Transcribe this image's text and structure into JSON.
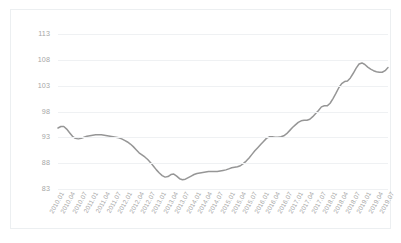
{
  "chart_data": {
    "type": "line",
    "title": "",
    "subtitle": "",
    "xlabel": "",
    "ylabel": "",
    "ylim": [
      83,
      113
    ],
    "yticks": [
      83,
      88,
      93,
      98,
      103,
      108,
      113
    ],
    "grid": true,
    "legend": false,
    "legend_position": "none",
    "line_color": "#969696",
    "gridline_color": "#eff1f3",
    "axis_label_color": "#a6a6a6",
    "border_color": "#eceff1",
    "x_tick_rotation": -61,
    "x_tick_labels": [
      "2010.01",
      "2010.04",
      "2010.07",
      "2011.01",
      "2011.04",
      "2011.07",
      "2012.01",
      "2012.04",
      "2012.07",
      "2013.01",
      "2013.04",
      "2013.07",
      "2014.01",
      "2014.04",
      "2014.07",
      "2015.01",
      "2015.04",
      "2015.07",
      "2016.01",
      "2016.04",
      "2016.07",
      "2017.01",
      "2017.04",
      "2017.07",
      "2018.01",
      "2018.04",
      "2018.07",
      "2019.01",
      "2019.04",
      "2019.07"
    ],
    "x": [
      "2010.01",
      "2010.02",
      "2010.03",
      "2010.04",
      "2010.05",
      "2010.06",
      "2010.07",
      "2010.08",
      "2010.09",
      "2010.10",
      "2010.11",
      "2010.12",
      "2011.01",
      "2011.02",
      "2011.03",
      "2011.04",
      "2011.05",
      "2011.06",
      "2011.07",
      "2011.08",
      "2011.09",
      "2011.10",
      "2011.11",
      "2011.12",
      "2012.01",
      "2012.02",
      "2012.03",
      "2012.04",
      "2012.05",
      "2012.06",
      "2012.07",
      "2012.08",
      "2012.09",
      "2012.10",
      "2012.11",
      "2012.12",
      "2013.01",
      "2013.02",
      "2013.03",
      "2013.04",
      "2013.05",
      "2013.06",
      "2013.07",
      "2013.08",
      "2013.09",
      "2013.10",
      "2013.11",
      "2013.12",
      "2014.01",
      "2014.02",
      "2014.03",
      "2014.04",
      "2014.05",
      "2014.06",
      "2014.07",
      "2014.08",
      "2014.09",
      "2014.10",
      "2014.11",
      "2014.12",
      "2015.01",
      "2015.02",
      "2015.03",
      "2015.04",
      "2015.05",
      "2015.06",
      "2015.07",
      "2015.08",
      "2015.09",
      "2015.10",
      "2015.11",
      "2015.12",
      "2016.01",
      "2016.02",
      "2016.03",
      "2016.04",
      "2016.05",
      "2016.06",
      "2016.07",
      "2016.08",
      "2016.09",
      "2016.10",
      "2016.11",
      "2016.12",
      "2017.01",
      "2017.02",
      "2017.03",
      "2017.04",
      "2017.05",
      "2017.06",
      "2017.07",
      "2017.08",
      "2017.09",
      "2017.10",
      "2017.11",
      "2017.12",
      "2018.01",
      "2018.02",
      "2018.03",
      "2018.04",
      "2018.05",
      "2018.06",
      "2018.07",
      "2018.08",
      "2018.09",
      "2018.10",
      "2018.11",
      "2018.12",
      "2019.01",
      "2019.02",
      "2019.03",
      "2019.04",
      "2019.05",
      "2019.06",
      "2019.07"
    ],
    "values": [
      94.8,
      95.1,
      95.1,
      94.6,
      93.9,
      93.2,
      92.8,
      92.7,
      92.8,
      93.0,
      93.2,
      93.3,
      93.4,
      93.5,
      93.5,
      93.5,
      93.4,
      93.3,
      93.2,
      93.1,
      93.0,
      92.9,
      92.7,
      92.4,
      92.1,
      91.7,
      91.2,
      90.6,
      90.0,
      89.6,
      89.2,
      88.7,
      88.1,
      87.4,
      86.7,
      86.1,
      85.6,
      85.3,
      85.4,
      85.8,
      85.9,
      85.5,
      85.0,
      84.8,
      84.9,
      85.2,
      85.5,
      85.8,
      86.0,
      86.1,
      86.2,
      86.3,
      86.4,
      86.4,
      86.4,
      86.4,
      86.5,
      86.6,
      86.7,
      86.9,
      87.1,
      87.2,
      87.3,
      87.5,
      87.9,
      88.4,
      89.0,
      89.7,
      90.4,
      91.0,
      91.6,
      92.2,
      92.8,
      93.1,
      93.1,
      93.0,
      93.0,
      93.1,
      93.3,
      93.7,
      94.3,
      94.9,
      95.4,
      95.9,
      96.2,
      96.3,
      96.3,
      96.5,
      97.0,
      97.6,
      98.2,
      98.9,
      99.1,
      99.1,
      99.6,
      100.5,
      101.5,
      102.6,
      103.4,
      103.8,
      103.9,
      104.5,
      105.4,
      106.4,
      107.2,
      107.4,
      107.1,
      106.6,
      106.2,
      105.9,
      105.7,
      105.6,
      105.6,
      105.9,
      106.5
    ]
  }
}
